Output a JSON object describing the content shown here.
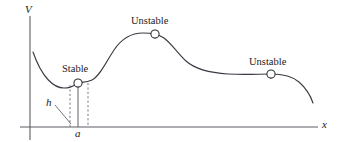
{
  "figure": {
    "axes": {
      "y_label": "V",
      "x_label": "x",
      "x_axis_y_px": 127,
      "y_axis_x_px": 30,
      "x_axis_from_px": 20,
      "x_axis_to_px": 318,
      "y_axis_from_px": 16,
      "y_axis_to_px": 140
    },
    "annotations": {
      "well_center_tick": "a",
      "well_width": "h"
    },
    "equilibria": [
      {
        "id": "stable-minimum",
        "label": "Stable",
        "type": "stable",
        "x_px": 78,
        "y_px": 83
      },
      {
        "id": "unstable-maximum",
        "label": "Unstable",
        "type": "unstable",
        "x_px": 155,
        "y_px": 34
      },
      {
        "id": "unstable-inflection",
        "label": "Unstable",
        "type": "unstable",
        "x_px": 271,
        "y_px": 74
      }
    ],
    "colors": {
      "curve": "#3b3b45",
      "axis": "#4a4a55",
      "marker_stroke": "#2a2a33",
      "guide": "#6a6a74",
      "text": "#1a1a1a",
      "background": "#ffffff"
    },
    "guides": {
      "left_dashed_x_px": 70,
      "right_dashed_x_px": 88,
      "solid_x_px": 78,
      "top_y_px": 84,
      "bottom_y_px": 127,
      "arrow_from": "55,105",
      "arrow_to": "71,124"
    }
  },
  "chart_data": {
    "type": "line",
    "title": "",
    "xlabel": "x",
    "ylabel": "V",
    "grid": false,
    "legend": null,
    "curve_path_px": "M 33,52 C 42,78 54,88 64,88 C 72,88 76,84 78,83 C 81,82 86,83 92,80 C 100,76 106,62 114,50 C 122,38 132,33 143,33 C 152,33 158,34 164,38 C 172,44 178,54 186,61 C 196,70 212,73 228,74 C 246,75 258,74 271,74 C 283,74 292,76 299,82 C 307,89 311,97 313,103",
    "annotations": [
      {
        "text": "Stable",
        "x_px": 62,
        "y_px": 64,
        "points_to": "stable-minimum"
      },
      {
        "text": "Unstable",
        "x_px": 131,
        "y_px": 16,
        "points_to": "unstable-maximum"
      },
      {
        "text": "Unstable",
        "x_px": 249,
        "y_px": 57,
        "points_to": "unstable-inflection"
      },
      {
        "text": "h",
        "x_px": 46,
        "y_px": 97,
        "points_to": "well-width"
      },
      {
        "text": "a",
        "x_px": 75,
        "y_px": 128,
        "points_to": "stable-minimum-x"
      }
    ],
    "markers": [
      {
        "label": "Stable",
        "x_px": 78,
        "y_px": 83
      },
      {
        "label": "Unstable",
        "x_px": 155,
        "y_px": 34
      },
      {
        "label": "Unstable",
        "x_px": 271,
        "y_px": 74
      }
    ]
  }
}
